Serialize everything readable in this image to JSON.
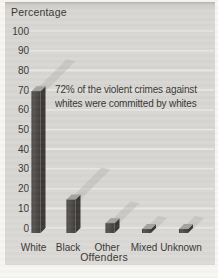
{
  "chart_data": {
    "type": "bar",
    "title": "",
    "ylabel": "Percentage",
    "xlabel": "Offenders",
    "categories": [
      "White",
      "Black",
      "Other",
      "Mixed",
      "Unknown"
    ],
    "values": [
      72,
      17,
      5,
      2,
      2
    ],
    "yticks": [
      100,
      90,
      80,
      70,
      60,
      50,
      40,
      30,
      20,
      10,
      0
    ],
    "ylim": [
      0,
      100
    ],
    "grid": true,
    "legend": "none",
    "annotation": {
      "line1": "72% of the violent crimes against",
      "line2": "whites were committed by whites"
    },
    "colors": {
      "panel_bg": "#d8d7d4",
      "gridline": "#e9e8e5",
      "text": "#3a3836",
      "bar_front_dark": "#2f2d2b",
      "bar_front_mid": "#5b5855",
      "bar_front": "#4d4a47",
      "bar_side": "#3c3a38",
      "bar_top": "#a4a29f",
      "shadow": "#bdbcb9"
    }
  }
}
